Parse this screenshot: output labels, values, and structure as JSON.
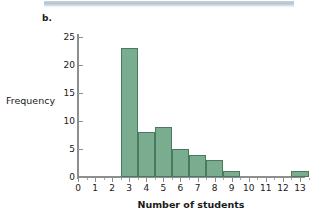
{
  "figure": {
    "panel_label": "b.",
    "top_strip_color": "#aec1cf",
    "bar_fill_color": "#7aac90",
    "bar_edge_color": "#4a7a5e",
    "axis_color": "#8e8e8e"
  },
  "chart_data": {
    "type": "bar",
    "title": "",
    "subtitle": "",
    "xlabel": "Number of students",
    "ylabel": "Frequency",
    "categories": [
      3,
      4,
      5,
      6,
      7,
      8,
      9,
      13
    ],
    "values": [
      23,
      8,
      9,
      5,
      4,
      3,
      1,
      1
    ],
    "bin_width": 1,
    "bin_edges": [
      2.5,
      3.5,
      4.5,
      5.5,
      6.5,
      7.5,
      8.5,
      9.5,
      12.5,
      13.5
    ],
    "xlim": [
      0,
      13.6
    ],
    "ylim": [
      0,
      26
    ],
    "xticks": [
      0,
      1,
      2,
      3,
      4,
      5,
      6,
      7,
      8,
      9,
      10,
      11,
      12,
      13
    ],
    "xtick_labels": [
      "0",
      "1",
      "2",
      "3",
      "4",
      "5",
      "6",
      "7",
      "8",
      "9",
      "10",
      "11",
      "12",
      "13"
    ],
    "yticks": [
      0,
      5,
      10,
      15,
      20,
      25
    ],
    "ytick_labels": [
      "0",
      "5",
      "10",
      "15",
      "20",
      "25"
    ],
    "minor_xticks": [
      0.5,
      1.5,
      2.5,
      3.5,
      4.5,
      5.5,
      6.5,
      7.5,
      8.5,
      9.5,
      10.5,
      11.5,
      12.5,
      13.5
    ],
    "grid": false,
    "legend": null
  }
}
